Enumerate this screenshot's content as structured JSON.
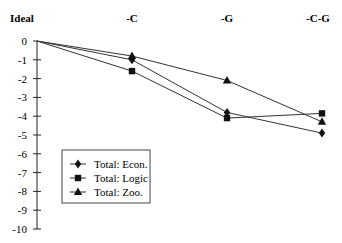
{
  "chart_data": {
    "type": "line",
    "title": "",
    "xlabel": "",
    "ylabel": "",
    "categories": [
      "Ideal",
      "-C",
      "-G",
      "-C-G"
    ],
    "category_axis_position": "top",
    "ylim": [
      -10,
      0
    ],
    "yticks": [
      0,
      -1,
      -2,
      -3,
      -4,
      -5,
      -6,
      -7,
      -8,
      -9,
      -10
    ],
    "grid": false,
    "legend_position": "lower-left inside",
    "series": [
      {
        "name": "Total: Econ.",
        "marker": "diamond",
        "values": [
          0,
          -1.0,
          -3.8,
          -4.9
        ]
      },
      {
        "name": "Total: Logic",
        "marker": "square",
        "values": [
          0,
          -1.6,
          -4.1,
          -3.85
        ]
      },
      {
        "name": "Total: Zoo.",
        "marker": "triangle",
        "values": [
          0,
          -0.8,
          -2.1,
          -4.3
        ]
      }
    ]
  },
  "legend": {
    "items": [
      {
        "label": "Total: Econ.",
        "marker": "diamond"
      },
      {
        "label": "Total: Logic",
        "marker": "square"
      },
      {
        "label": "Total: Zoo.",
        "marker": "triangle"
      }
    ]
  },
  "colors": {
    "line": "#333333",
    "marker": "#111111",
    "axis": "#222222"
  }
}
